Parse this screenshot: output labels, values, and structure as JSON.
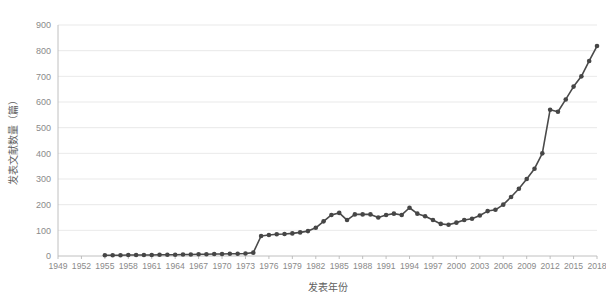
{
  "chart_data": {
    "type": "line",
    "title": "",
    "xlabel": "发表年份",
    "ylabel": "发表文献数量（篇）",
    "xlim": [
      1949,
      2018
    ],
    "ylim": [
      0,
      900
    ],
    "ytick_step": 100,
    "xtick_step": 3,
    "grid": true,
    "legend": "none",
    "marker": "circle",
    "line_color": "#4a4a4a",
    "marker_color": "#464646",
    "grid_color": "#e3e3e3",
    "axis_color": "#b9b9b9",
    "text_color": "#8a8a8a",
    "yticks": [
      0,
      100,
      200,
      300,
      400,
      500,
      600,
      700,
      800,
      900
    ],
    "ytick_labels": [
      "0",
      "100",
      "200",
      "300",
      "400",
      "500",
      "600",
      "700",
      "800",
      "900"
    ],
    "xticks": [
      1949,
      1952,
      1955,
      1958,
      1961,
      1964,
      1967,
      1970,
      1973,
      1976,
      1979,
      1982,
      1985,
      1988,
      1991,
      1994,
      1997,
      2000,
      2003,
      2006,
      2009,
      2012,
      2015,
      2018
    ],
    "xtick_labels": [
      "1949",
      "1952",
      "1955",
      "1958",
      "1961",
      "1964",
      "1967",
      "1970",
      "1973",
      "1976",
      "1979",
      "1982",
      "1985",
      "1988",
      "1991",
      "1994",
      "1997",
      "2000",
      "2003",
      "2006",
      "2009",
      "2012",
      "2015",
      "2018"
    ],
    "x": [
      1955,
      1956,
      1957,
      1958,
      1959,
      1960,
      1961,
      1962,
      1963,
      1964,
      1965,
      1966,
      1967,
      1968,
      1969,
      1970,
      1971,
      1972,
      1973,
      1974,
      1975,
      1976,
      1977,
      1978,
      1979,
      1980,
      1981,
      1982,
      1983,
      1984,
      1985,
      1986,
      1987,
      1988,
      1989,
      1990,
      1991,
      1992,
      1993,
      1994,
      1995,
      1996,
      1997,
      1998,
      1999,
      2000,
      2001,
      2002,
      2003,
      2004,
      2005,
      2006,
      2007,
      2008,
      2009,
      2010,
      2011,
      2012,
      2013,
      2014,
      2015,
      2016,
      2017,
      2018
    ],
    "values": [
      3,
      3,
      3,
      4,
      4,
      4,
      4,
      5,
      5,
      5,
      6,
      6,
      7,
      7,
      8,
      8,
      9,
      9,
      10,
      13,
      78,
      82,
      85,
      86,
      88,
      92,
      97,
      110,
      135,
      160,
      168,
      140,
      162,
      162,
      162,
      150,
      160,
      165,
      160,
      188,
      165,
      155,
      140,
      125,
      122,
      130,
      140,
      145,
      158,
      175,
      180,
      200,
      230,
      262,
      300,
      340,
      400,
      570,
      562,
      610,
      660,
      700,
      760,
      818
    ],
    "series": [
      {
        "name": "发表文献数量",
        "values": [
          3,
          3,
          3,
          4,
          4,
          4,
          4,
          5,
          5,
          5,
          6,
          6,
          7,
          7,
          8,
          8,
          9,
          9,
          10,
          13,
          78,
          82,
          85,
          86,
          88,
          92,
          97,
          110,
          135,
          160,
          168,
          140,
          162,
          162,
          162,
          150,
          160,
          165,
          160,
          188,
          165,
          155,
          140,
          125,
          122,
          130,
          140,
          145,
          158,
          175,
          180,
          200,
          230,
          262,
          300,
          340,
          400,
          570,
          562,
          610,
          660,
          700,
          760,
          818
        ]
      }
    ]
  }
}
